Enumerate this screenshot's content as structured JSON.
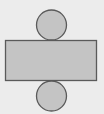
{
  "diagram": {
    "colors": {
      "background": "#ececec",
      "fill": "#c4c4c4",
      "stroke": "#5a5a5a"
    },
    "shapes": [
      {
        "type": "circle",
        "role": "top-base",
        "cx": 51.5,
        "cy": 25,
        "r": 15
      },
      {
        "type": "rect",
        "role": "lateral-surface",
        "x": 5.5,
        "y": 40.5,
        "width": 91,
        "height": 40
      },
      {
        "type": "circle",
        "role": "bottom-base",
        "cx": 51.5,
        "cy": 96,
        "r": 15
      }
    ]
  }
}
